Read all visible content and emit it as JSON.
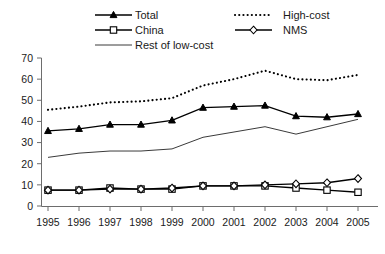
{
  "chart_data": {
    "type": "line",
    "title": "",
    "subtitle": "",
    "xlabel": "",
    "ylabel": "",
    "x": [
      1995,
      1996,
      1997,
      1998,
      1999,
      2000,
      2001,
      2002,
      2003,
      2004,
      2005
    ],
    "categories": [
      "1995",
      "1996",
      "1997",
      "1998",
      "1999",
      "2000",
      "2001",
      "2002",
      "2003",
      "2004",
      "2005"
    ],
    "xlim": [
      1995,
      2005
    ],
    "ylim": [
      0,
      70
    ],
    "yticks": [
      0,
      10,
      20,
      30,
      40,
      50,
      60,
      70
    ],
    "ytick_labels": [
      "0",
      "10",
      "20",
      "30",
      "40",
      "50",
      "60",
      "70"
    ],
    "grid": false,
    "legend_position": "top",
    "series": [
      {
        "name": "Total",
        "marker": "triangle-filled",
        "linestyle": "solid",
        "color": "#000000",
        "values": [
          35.5,
          36.5,
          38.5,
          38.5,
          40.5,
          46.5,
          47.0,
          47.5,
          42.5,
          42.0,
          43.5
        ]
      },
      {
        "name": "China",
        "marker": "square-open",
        "linestyle": "solid",
        "color": "#000000",
        "values": [
          7.5,
          7.5,
          8.5,
          8.0,
          8.0,
          9.5,
          9.5,
          9.5,
          8.5,
          7.5,
          6.5
        ]
      },
      {
        "name": "Rest of low-cost",
        "marker": "none",
        "linestyle": "solid",
        "color": "#3a3a3a",
        "values": [
          23.0,
          25.0,
          26.0,
          26.0,
          27.0,
          32.5,
          35.0,
          37.5,
          34.0,
          37.5,
          41.0
        ]
      },
      {
        "name": "High-cost",
        "marker": "none",
        "linestyle": "dotted",
        "color": "#000000",
        "values": [
          45.5,
          47.0,
          49.0,
          49.5,
          51.0,
          57.0,
          60.0,
          64.0,
          60.0,
          59.5,
          62.0
        ]
      },
      {
        "name": "NMS",
        "marker": "diamond-open",
        "linestyle": "solid",
        "color": "#000000",
        "values": [
          7.5,
          7.5,
          8.0,
          8.0,
          8.5,
          9.5,
          9.5,
          10.0,
          10.5,
          11.0,
          13.0
        ]
      }
    ]
  },
  "legend": {
    "entries": [
      {
        "label": "Total",
        "key": "total"
      },
      {
        "label": "High-cost",
        "key": "high-cost"
      },
      {
        "label": "China",
        "key": "china"
      },
      {
        "label": "NMS",
        "key": "nms"
      },
      {
        "label": "Rest of low-cost",
        "key": "rest-of-low-cost"
      }
    ]
  }
}
